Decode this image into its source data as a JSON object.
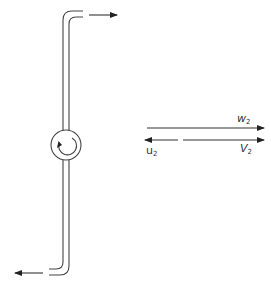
{
  "diagram": {
    "type": "velocity-triangle / rotating sprinkler arm",
    "colors": {
      "stroke": "#333333",
      "background": "#ffffff"
    },
    "labels": {
      "w2": {
        "base": "w",
        "sub": "2"
      },
      "V2": {
        "base": "V",
        "sub": "2"
      },
      "u2": {
        "base": "u",
        "sub": "2"
      }
    },
    "elements": [
      "vertical-pipe-arm",
      "top-outlet-arrow-right",
      "bottom-outlet-arrow-left",
      "hub-circle-with-rotation-arrow",
      "relative-velocity-arrow-w2",
      "absolute-velocity-arrow-V2",
      "blade-velocity-arrow-u2"
    ]
  }
}
